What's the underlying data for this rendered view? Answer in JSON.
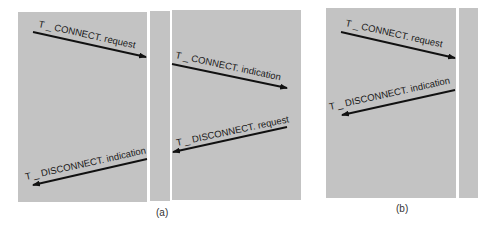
{
  "diagrams": [
    {
      "id": "a",
      "caption": "(a)",
      "primitives": [
        {
          "label": "T _ CONNECT. request",
          "direction": "left-to-middle"
        },
        {
          "label": "T _ CONNECT. indication",
          "direction": "middle-to-right"
        },
        {
          "label": "T _ DISCONNECT. request",
          "direction": "right-to-middle"
        },
        {
          "label": "T _ DISCONNECT. indication",
          "direction": "middle-to-left"
        }
      ]
    },
    {
      "id": "b",
      "caption": "(b)",
      "primitives": [
        {
          "label": "T _ CONNECT. request",
          "direction": "left-to-middle"
        },
        {
          "label": "T _ DISCONNECT. indication",
          "direction": "middle-to-left"
        }
      ]
    }
  ],
  "colors": {
    "panel": "#c3c3c3",
    "arrow": "#111111",
    "background": "#ffffff"
  }
}
